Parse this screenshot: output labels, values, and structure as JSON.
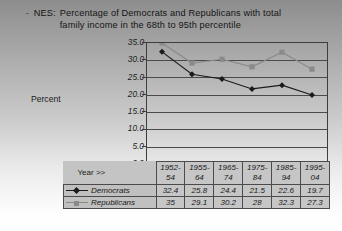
{
  "slide": {
    "bullet_glyph": "-",
    "title_prefix": "NES:",
    "title_line1": "Percentage of Democrats and Republicans with total",
    "title_line2": "family income in the 68th to 95th percentile"
  },
  "axis": {
    "y_title": "Percent",
    "x_title": "Year >>",
    "y_ticks": [
      "35.0",
      "30.0",
      "25.0",
      "20.0",
      "15.0",
      "10.0",
      "5.0",
      "0.0"
    ]
  },
  "colors": {
    "democrats": "#1a1a1a",
    "republicans": "#8a8a8a",
    "plot_border": "#3d3d3d",
    "gridline": "#4a4a4a",
    "table_fill": "#c6c6c6"
  },
  "legend": {
    "democrats_label": "Democrats",
    "republicans_label": "Republicans"
  },
  "chart_data": {
    "type": "line",
    "xlabel": "Year >>",
    "ylabel": "Percent",
    "ylim": [
      0.0,
      35.0
    ],
    "ytick_step": 5.0,
    "grid": true,
    "legend_position": "table-below",
    "categories": [
      "1952-54",
      "1955-64",
      "1965-74",
      "1975-84",
      "1985-94",
      "1995-04"
    ],
    "series": [
      {
        "name": "Democrats",
        "values": [
          32.4,
          25.8,
          24.4,
          21.5,
          22.6,
          19.7
        ],
        "marker": "diamond",
        "color": "#1a1a1a"
      },
      {
        "name": "Republicans",
        "values": [
          35.0,
          29.1,
          30.2,
          28.0,
          32.3,
          27.3
        ],
        "marker": "square",
        "color": "#8a8a8a"
      }
    ]
  }
}
